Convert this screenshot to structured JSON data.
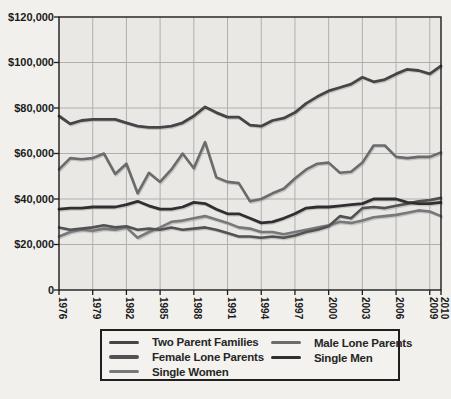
{
  "figure": {
    "page_background": "#f2f0ec",
    "plot_background": "#e9e8e4",
    "grid_color": "#b0afab",
    "axis_color": "#1c1c1c",
    "text_color": "#1b1b1b",
    "shadow_color": "#9a9995"
  },
  "chart_data": {
    "type": "line",
    "title": "",
    "xlabel": "",
    "ylabel": "",
    "xlim": [
      1976,
      2010
    ],
    "ylim": [
      0,
      120000
    ],
    "grid": true,
    "x": [
      1976,
      1977,
      1978,
      1979,
      1980,
      1981,
      1982,
      1983,
      1984,
      1985,
      1986,
      1987,
      1988,
      1989,
      1990,
      1991,
      1992,
      1993,
      1994,
      1995,
      1996,
      1997,
      1998,
      1999,
      2000,
      2001,
      2002,
      2003,
      2004,
      2005,
      2006,
      2007,
      2008,
      2009,
      2010
    ],
    "x_tick_years": [
      1976,
      1979,
      1982,
      1985,
      1988,
      1991,
      1994,
      1997,
      2000,
      2003,
      2006,
      2009,
      2010
    ],
    "x_tick_labels": [
      "1976",
      "1979",
      "1982",
      "1985",
      "1988",
      "1991",
      "1994",
      "1997",
      "2000",
      "2003",
      "2006",
      "2009",
      "2010"
    ],
    "y_ticks": [
      {
        "value": 120000,
        "label": "$120,000"
      },
      {
        "value": 100000,
        "label": "$100,000"
      },
      {
        "value": 80000,
        "label": "$80,000"
      },
      {
        "value": 60000,
        "label": "$60,000"
      },
      {
        "value": 40000,
        "label": "$40,000"
      },
      {
        "value": 20000,
        "label": "$20,000"
      },
      {
        "value": 0,
        "label": "0"
      }
    ],
    "series": [
      {
        "name": "Two Parent Families",
        "color": "#454547",
        "values": [
          76500,
          73000,
          74500,
          75000,
          75000,
          75000,
          73500,
          72000,
          71500,
          71500,
          72000,
          73500,
          76500,
          80500,
          78000,
          76000,
          76000,
          72500,
          72000,
          74500,
          75500,
          78000,
          82000,
          85000,
          87500,
          89000,
          90500,
          93500,
          91500,
          92500,
          95000,
          97000,
          96500,
          95000,
          98500
        ]
      },
      {
        "name": "Female Lone Parents",
        "color": "#525254",
        "values": [
          27500,
          26500,
          27000,
          27500,
          28500,
          27500,
          28000,
          26500,
          27000,
          26500,
          27500,
          26500,
          27000,
          27500,
          26500,
          25000,
          23500,
          23500,
          23000,
          23500,
          23000,
          24000,
          25500,
          26500,
          28000,
          32500,
          31500,
          36000,
          36500,
          36000,
          37000,
          38000,
          39000,
          39500,
          40500
        ]
      },
      {
        "name": "Single Women",
        "color": "#77787a",
        "values": [
          23500,
          25500,
          26500,
          26000,
          27000,
          26500,
          27500,
          23000,
          25500,
          27500,
          30000,
          30500,
          31500,
          32500,
          31000,
          29500,
          27500,
          27000,
          25500,
          25500,
          24500,
          25500,
          26500,
          27500,
          28500,
          30000,
          29500,
          30500,
          32000,
          32500,
          33000,
          34000,
          35000,
          34500,
          32500
        ]
      },
      {
        "name": "Male Lone Parents",
        "color": "#6a6b6d",
        "values": [
          53000,
          58000,
          57500,
          58000,
          60000,
          51000,
          55500,
          42500,
          51500,
          47500,
          53000,
          60000,
          53500,
          65000,
          49500,
          47500,
          47000,
          39000,
          40000,
          42500,
          44500,
          49000,
          53000,
          55500,
          56000,
          51500,
          52000,
          56000,
          63500,
          63500,
          58500,
          58000,
          58500,
          58500,
          60500
        ]
      },
      {
        "name": "Single Men",
        "color": "#2f2f31",
        "values": [
          35500,
          36000,
          36000,
          36500,
          36500,
          36500,
          37500,
          39000,
          37000,
          35500,
          35500,
          36500,
          38500,
          38000,
          35500,
          33500,
          33500,
          31500,
          29500,
          30000,
          31500,
          33500,
          36000,
          36500,
          36500,
          37000,
          37500,
          38000,
          40000,
          40000,
          40000,
          38500,
          38000,
          38000,
          38500
        ]
      }
    ],
    "legend": {
      "position": "bottom",
      "columns": [
        [
          "Two Parent Families",
          "Female Lone Parents",
          "Single Women"
        ],
        [
          "Male Lone Parents",
          "Single Men"
        ]
      ]
    }
  }
}
